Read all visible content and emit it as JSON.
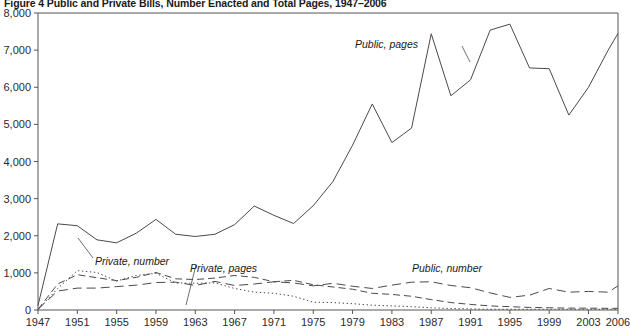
{
  "figure": {
    "title": "Figure 4  Public and Private Bills, Number Enacted and Total Pages, 1947–2006"
  },
  "axes": {
    "y_ticks": [
      "0",
      "1,000",
      "2,000",
      "3,000",
      "4,000",
      "5,000",
      "6,000",
      "7,000",
      "8,000"
    ],
    "x_ticks": [
      "1947",
      "1951",
      "1955",
      "1959",
      "1963",
      "1967",
      "1971",
      "1975",
      "1979",
      "1983",
      "1987",
      "1991",
      "1995",
      "1999",
      "2003",
      "2006"
    ]
  },
  "annotations": {
    "public_pages": "Public, pages",
    "private_number": "Private, number",
    "private_pages": "Private, pages",
    "public_number": "Public, number"
  },
  "colors": {
    "ink": "#4a4a4a",
    "text": "#1a1a1a",
    "background": "#ffffff"
  },
  "chart_data": {
    "type": "line",
    "title": "Figure 4  Public and Private Bills, Number Enacted and Total Pages, 1947–2006",
    "xlabel": "",
    "ylabel": "",
    "xlim": [
      1947,
      2006
    ],
    "ylim": [
      0,
      8000
    ],
    "grid": false,
    "legend_position": "inline-annotations",
    "x": [
      1947,
      1949,
      1951,
      1953,
      1955,
      1957,
      1959,
      1961,
      1963,
      1965,
      1967,
      1969,
      1971,
      1973,
      1975,
      1977,
      1979,
      1981,
      1983,
      1985,
      1987,
      1989,
      1991,
      1993,
      1995,
      1997,
      1999,
      2001,
      2003,
      2005,
      2006
    ],
    "series": [
      {
        "name": "Public, pages",
        "style": "solid",
        "values": [
          120,
          2320,
          2270,
          1890,
          1810,
          2070,
          2440,
          2040,
          1980,
          2040,
          2300,
          2800,
          2550,
          2330,
          2810,
          3460,
          4440,
          5550,
          4510,
          4900,
          7440,
          5770,
          6200,
          7540,
          7700,
          6520,
          6500,
          5250,
          6000,
          7000,
          7450
        ]
      },
      {
        "name": "Public, number",
        "style": "long-dash",
        "values": [
          20,
          510,
          590,
          590,
          630,
          670,
          740,
          750,
          660,
          770,
          660,
          700,
          760,
          730,
          650,
          720,
          640,
          580,
          670,
          750,
          760,
          660,
          600,
          460,
          340,
          400,
          580,
          480,
          500,
          480,
          650
        ]
      },
      {
        "name": "Private, number",
        "style": "dotted",
        "values": [
          10,
          580,
          1060,
          1010,
          780,
          930,
          990,
          730,
          720,
          730,
          580,
          480,
          450,
          370,
          210,
          200,
          170,
          130,
          110,
          90,
          60,
          40,
          30,
          20,
          20,
          20,
          20,
          20,
          20,
          20,
          20
        ]
      },
      {
        "name": "Private, pages",
        "style": "dash",
        "values": [
          15,
          700,
          950,
          870,
          790,
          880,
          1010,
          840,
          820,
          860,
          930,
          880,
          760,
          800,
          680,
          620,
          560,
          450,
          420,
          370,
          280,
          200,
          150,
          110,
          90,
          70,
          60,
          50,
          50,
          45,
          45
        ]
      }
    ]
  }
}
